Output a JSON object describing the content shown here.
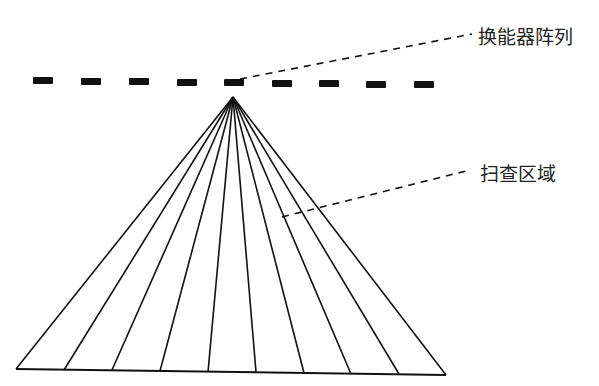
{
  "labels": {
    "transducer_array": "换能器阵列",
    "scan_area": "扫查区域"
  },
  "diagram": {
    "apex": [
      233,
      97
    ],
    "array_dashes_x": [
      33,
      81,
      129,
      177,
      224,
      272,
      319,
      366,
      414
    ],
    "array_y": 78,
    "ray_ends": [
      [
        16,
        369
      ],
      [
        64,
        370
      ],
      [
        112,
        370
      ],
      [
        160,
        371
      ],
      [
        208,
        372
      ],
      [
        256,
        372
      ],
      [
        304,
        373
      ],
      [
        351,
        374
      ],
      [
        399,
        374
      ],
      [
        446,
        375
      ]
    ],
    "colors": {
      "stroke": "#111111",
      "text": "#222222",
      "background": "#ffffff"
    }
  }
}
